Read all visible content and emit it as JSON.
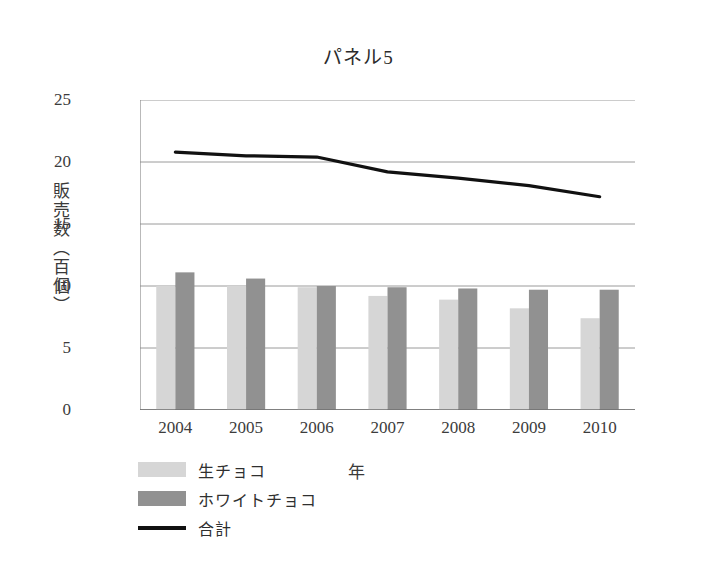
{
  "chart_data": {
    "type": "bar",
    "title": "パネル5",
    "xlabel": "年",
    "ylabel": "販売数（百個）",
    "categories": [
      "2004",
      "2005",
      "2006",
      "2007",
      "2008",
      "2009",
      "2010"
    ],
    "ylim": [
      0,
      25
    ],
    "yticks": [
      0,
      5,
      10,
      15,
      20,
      25
    ],
    "grid": true,
    "legend_position": "bottom-left",
    "series": [
      {
        "name": "生チョコ",
        "type": "bar",
        "color": "#d6d6d6",
        "values": [
          10.0,
          10.0,
          9.9,
          9.2,
          8.9,
          8.2,
          7.4
        ]
      },
      {
        "name": "ホワイトチョコ",
        "type": "bar",
        "color": "#919191",
        "values": [
          11.1,
          10.6,
          10.0,
          9.9,
          9.8,
          9.7,
          9.7
        ]
      },
      {
        "name": "合計",
        "type": "line",
        "color": "#111111",
        "values": [
          20.8,
          20.5,
          20.4,
          19.2,
          18.7,
          18.1,
          17.2
        ]
      }
    ]
  },
  "axis": {
    "ytick_labels": [
      "0",
      "5",
      "10",
      "15",
      "20",
      "25"
    ],
    "xtick_labels": [
      "2004",
      "2005",
      "2006",
      "2007",
      "2008",
      "2009",
      "2010"
    ]
  },
  "legend": {
    "items": [
      {
        "label": "生チョコ",
        "marker": "swatch-light"
      },
      {
        "label": "ホワイトチョコ",
        "marker": "swatch-dark"
      },
      {
        "label": "合計",
        "marker": "line-black"
      }
    ]
  }
}
